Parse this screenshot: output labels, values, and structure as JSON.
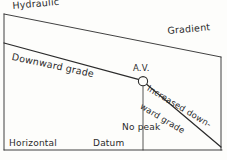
{
  "diagram": {
    "background_color": "#fdfdfb",
    "ink_color": "#2b2b2b",
    "labels": {
      "hydraulic": "Hydraulic",
      "gradient": "Gradient",
      "downward_grade": "Downward grade",
      "air_valve": "A.V.",
      "increased_line1": "Increased down-",
      "increased_line2": "ward grade",
      "no_peak": "No peak",
      "horizontal": "Horizontal",
      "datum": "Datum"
    },
    "geometry": {
      "left_vertical": {
        "x": 4,
        "y1": 14,
        "y2": 150
      },
      "right_vertical": {
        "x": 221,
        "y1": 57,
        "y2": 150
      },
      "bottom_horizontal": {
        "x1": 4,
        "x2": 222,
        "y": 150
      },
      "hydraulic_gradient_line": {
        "x1": 4,
        "y1": 14,
        "x2": 221,
        "y2": 57
      },
      "downward_grade_line": {
        "x1": 4,
        "y1": 43,
        "x2": 139,
        "y2": 80
      },
      "increased_downward_grade_line": {
        "x1": 147,
        "y1": 84,
        "x2": 221,
        "y2": 147
      },
      "drop_vertical": {
        "x": 143,
        "y1": 86,
        "y2": 150
      },
      "air_valve_circle": {
        "cx": 143,
        "cy": 81,
        "r": 4.6
      }
    }
  }
}
